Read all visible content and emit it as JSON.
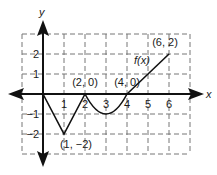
{
  "chart_data": {
    "type": "line",
    "title": "",
    "xlabel": "x",
    "ylabel": "y",
    "function_label": "f(x)",
    "xlim": [
      -1,
      7
    ],
    "ylim": [
      -3,
      3
    ],
    "grid": true,
    "grid_style": "dashed",
    "x_ticks": [
      1,
      2,
      3,
      4,
      5,
      6
    ],
    "y_ticks": [
      2,
      1,
      -1,
      -2
    ],
    "x_tick_labels": [
      "1",
      "2",
      "3",
      "4",
      "5",
      "6"
    ],
    "y_tick_labels": [
      "2",
      "1",
      "−1",
      "−2"
    ],
    "series": [
      {
        "name": "f(x)",
        "segments": [
          {
            "kind": "linear",
            "points": [
              [
                0,
                0
              ],
              [
                1,
                -2
              ],
              [
                2,
                0
              ]
            ]
          },
          {
            "kind": "parabola",
            "points": [
              [
                2,
                0
              ],
              [
                3,
                -1
              ],
              [
                4,
                0
              ]
            ]
          },
          {
            "kind": "linear",
            "points": [
              [
                4,
                0
              ],
              [
                6,
                2
              ]
            ]
          }
        ]
      }
    ],
    "annotations": [
      {
        "text": "(2, 0)",
        "x": 2,
        "y": 0
      },
      {
        "text": "(4, 0)",
        "x": 4,
        "y": 0
      },
      {
        "text": "(1, −2)",
        "x": 1,
        "y": -2
      },
      {
        "text": "(6, 2)",
        "x": 6,
        "y": 2
      }
    ]
  }
}
